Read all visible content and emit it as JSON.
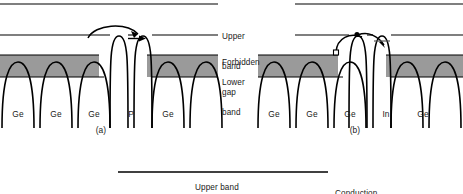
{
  "figure": {
    "type": "energy-band-diagram",
    "band_labels": {
      "upper_band": "Upper\nband",
      "forbidden_gap": "Forbidden\ngap",
      "lower_band": "Lower\nband",
      "upper_band_line1": "Upper",
      "upper_band_line2": "band",
      "forbidden_gap_line1": "Forbidden",
      "forbidden_gap_line2": "gap",
      "lower_band_line1": "Lower",
      "lower_band_line2": "band"
    },
    "panels": [
      {
        "id": "a",
        "caption": "(a)",
        "atoms": [
          "Ge",
          "Ge",
          "Ge",
          "P",
          "Ge"
        ],
        "dopant": "P",
        "dopant_type": "donor",
        "carrier_symbol": "electron",
        "has_curved_arrow": true,
        "has_straight_arrow": true
      },
      {
        "id": "b",
        "caption": "(b)",
        "atoms": [
          "Ge",
          "Ge",
          "Ge",
          "In",
          "Ge"
        ],
        "dopant": "In",
        "dopant_type": "acceptor",
        "carrier_symbol": "hole",
        "has_curved_arrow": true,
        "has_straight_arrow": true,
        "has_hole_square": true,
        "has_electron_dot": true
      }
    ],
    "bottom_figure": {
      "labels": [
        "Upper band",
        "Conduction"
      ],
      "upper_band_label": "Upper band",
      "conduction_label": "Conduction"
    },
    "colors": {
      "band_fill": "#9a9a9a",
      "stroke": "#000000",
      "text": "#1a1a1a",
      "background": "#ffffff"
    }
  }
}
